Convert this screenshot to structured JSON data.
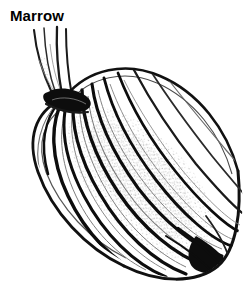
{
  "page": {
    "width": 249,
    "height": 285,
    "background_color": "#ffffff"
  },
  "title": {
    "text": "Marrow",
    "color": "#000000"
  },
  "illustration": {
    "subject": "marrow",
    "caption": "Marrow",
    "style": "black-and-white line engraving with stippled shading",
    "ink_color": "#000000",
    "mid_tone_color": "#555555",
    "stipple_color": "#9a9a9a",
    "paper_color": "#ffffff",
    "orientation": "diagonal, stem at upper-left, blossom end at lower-right",
    "parts": [
      {
        "name": "stem",
        "label": "stem",
        "strand_count": 4,
        "top_y": 28,
        "base_y": 98
      },
      {
        "name": "shoulder-knot",
        "label": "stem attachment knot",
        "center_x": 66,
        "center_y": 98
      },
      {
        "name": "body",
        "label": "fruit body",
        "center_x": 140,
        "center_y": 185,
        "length": 235,
        "width": 120,
        "tilt_degrees": 43,
        "rib_count": 11
      },
      {
        "name": "blossom-end",
        "label": "blossom end",
        "center_x": 224,
        "center_y": 261
      }
    ]
  }
}
